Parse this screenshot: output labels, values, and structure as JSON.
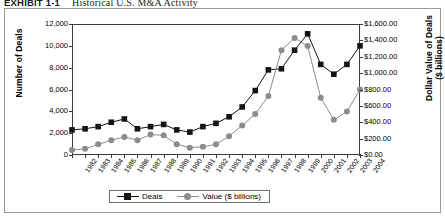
{
  "exhibit": {
    "label": "EXHIBIT 1-1",
    "title": "Historical U.S. M&A Activity"
  },
  "legend": {
    "items": [
      {
        "name": "deals",
        "label": "Deals",
        "marker": "square",
        "color": "#141414"
      },
      {
        "name": "value",
        "label": "Value ($ billions)",
        "marker": "circle",
        "color": "#8c8c8c"
      }
    ]
  },
  "axes": {
    "y_left": {
      "title": "Number of Deals",
      "ticks": [
        "12,000",
        "10,000",
        "8,000",
        "6,000",
        "4,000",
        "2,000",
        "0"
      ],
      "min": 0,
      "max": 12000,
      "step": 2000
    },
    "y_right": {
      "title": "Dollar Value of  Deals ($ billions)",
      "title_line1": "Dollar Value of  Deals",
      "title_line2": "($ billions)",
      "ticks": [
        "$1,600.00",
        "$1,400.00",
        "$1,200.00",
        "$1,000.00",
        "$800.00",
        "$600.00",
        "$400.00",
        "$200.00",
        "$0.00"
      ],
      "min": 0,
      "max": 1600,
      "step": 200
    },
    "x": {
      "title": "",
      "ticks": [
        "1982",
        "1983",
        "1984",
        "1985",
        "1986",
        "1987",
        "1988",
        "1989",
        "1990",
        "1991",
        "1992",
        "1993",
        "1994",
        "1995",
        "1996",
        "1997",
        "1998",
        "1999",
        "2000",
        "2001",
        "2002",
        "2003",
        "2004"
      ]
    }
  },
  "chart_data": {
    "type": "line",
    "title": "Historical U.S. M&A Activity",
    "xlabel": "",
    "ylabel": "Number of Deals",
    "y2label": "Dollar Value of Deals ($ billions)",
    "grid": false,
    "legend_position": "bottom",
    "categories": [
      "1982",
      "1983",
      "1984",
      "1985",
      "1986",
      "1987",
      "1988",
      "1989",
      "1990",
      "1991",
      "1992",
      "1993",
      "1994",
      "1995",
      "1996",
      "1997",
      "1998",
      "1999",
      "2000",
      "2001",
      "2002",
      "2003",
      "2004"
    ],
    "ylim": [
      0,
      12000
    ],
    "y2lim": [
      0,
      1600
    ],
    "series": [
      {
        "name": "Deals",
        "axis": "left",
        "marker": "square",
        "color": "#141414",
        "values": [
          2300,
          2400,
          2600,
          3000,
          3300,
          2400,
          2600,
          2800,
          2300,
          2100,
          2600,
          2900,
          3500,
          4400,
          5900,
          7800,
          7900,
          9600,
          11100,
          8300,
          7400,
          8300,
          10000
        ]
      },
      {
        "name": "Value ($ billions)",
        "axis": "right",
        "marker": "circle",
        "color": "#8c8c8c",
        "values": [
          60,
          75,
          130,
          180,
          220,
          180,
          250,
          240,
          130,
          90,
          100,
          130,
          230,
          360,
          500,
          720,
          1280,
          1430,
          1330,
          700,
          430,
          530,
          800
        ]
      }
    ]
  }
}
